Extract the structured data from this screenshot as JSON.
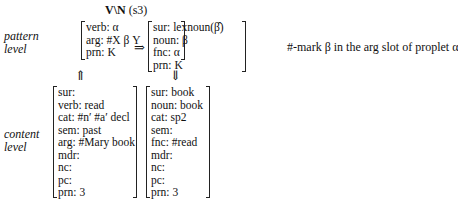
{
  "title": {
    "rule": "V\\N",
    "label": "(s3)"
  },
  "labels": {
    "pattern": [
      "pattern",
      "level"
    ],
    "content": [
      "content",
      "level"
    ]
  },
  "pattern_level": {
    "left_fs": [
      "verb: α",
      "arg: #X β Y",
      "prn: K"
    ],
    "right_fs": [
      "sur: lexnoun(β̂)",
      "noun: β",
      "fnc: α",
      "prn: K"
    ]
  },
  "content_level": {
    "left_fs": [
      "sur:",
      "verb: read",
      "cat: #n′ #a′ decl",
      "sem: past",
      "arg: #Mary book",
      "mdr:",
      "nc:",
      "pc:",
      "prn: 3"
    ],
    "right_fs": [
      "sur: book",
      "noun: book",
      "cat: sp2",
      "sem:",
      "fnc: #read",
      "mdr:",
      "nc:",
      "pc:",
      "prn: 3"
    ]
  },
  "arrows": {
    "rule_arrow": "⇒",
    "up": "⇑",
    "down": "⇓"
  },
  "note": "#-mark β in the arg slot of proplet α"
}
